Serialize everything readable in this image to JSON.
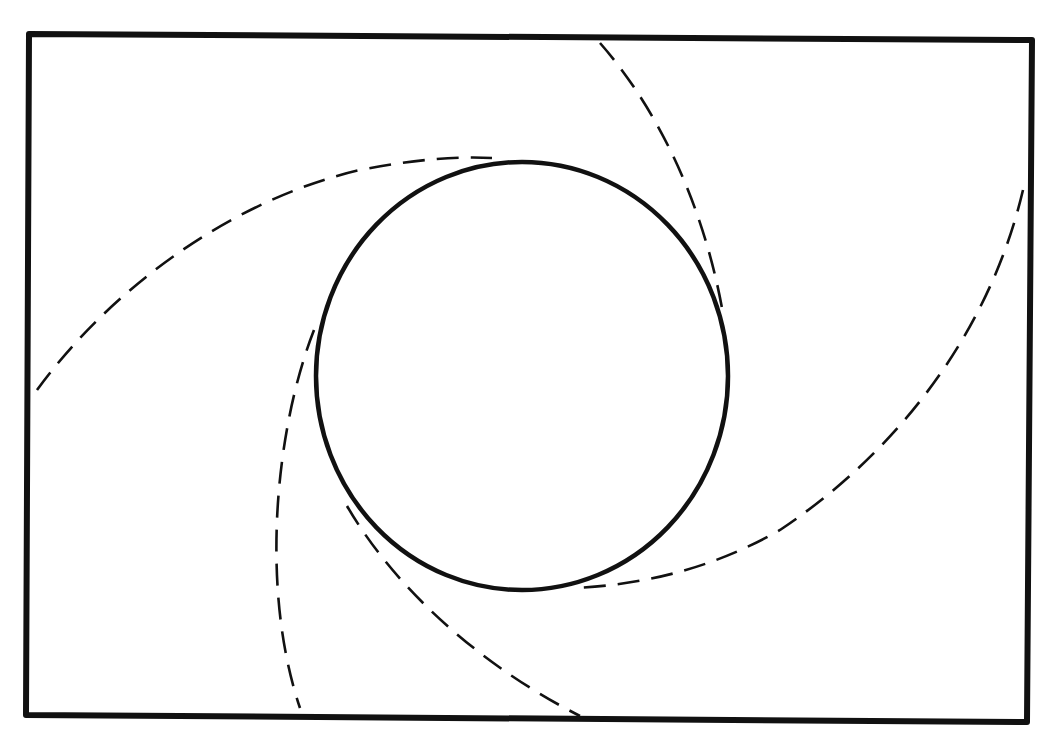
{
  "diagram": {
    "type": "line-art",
    "colors": {
      "background": "#ffffff",
      "stroke": "#111111"
    },
    "frame": {
      "corners": [
        [
          29,
          34
        ],
        [
          1032,
          40
        ],
        [
          1027,
          722
        ],
        [
          26,
          715
        ]
      ],
      "stroke_width": 6
    },
    "circle": {
      "cx": 522,
      "cy": 376,
      "rx": 206,
      "ry": 214,
      "stroke_width": 4.5,
      "style": "solid"
    },
    "arcs": [
      {
        "name": "upper-left-arc",
        "style": "dashed",
        "start": [
          37,
          390
        ],
        "end": [
          492,
          158
        ],
        "path": "M37,390 C110,290 230,200 360,170 C410,160 455,156 492,158"
      },
      {
        "name": "upper-right-arc",
        "style": "dashed",
        "start": [
          600,
          43
        ],
        "end": [
          722,
          308
        ],
        "path": "M600,43 C650,100 700,190 722,308"
      },
      {
        "name": "right-arc",
        "style": "dashed",
        "start": [
          1023,
          190
        ],
        "end": [
          574,
          588
        ],
        "path": "M1023,190 C990,330 900,450 780,530 C710,570 640,585 574,588"
      },
      {
        "name": "lower-left-arc",
        "style": "dashed",
        "start": [
          314,
          330
        ],
        "end": [
          300,
          708
        ],
        "path": "M314,330 C275,430 260,590 300,708"
      },
      {
        "name": "bottom-arc",
        "style": "dashed",
        "start": [
          347,
          506
        ],
        "end": [
          580,
          716
        ],
        "path": "M347,506 C390,580 470,660 580,716"
      }
    ],
    "text_labels": []
  }
}
